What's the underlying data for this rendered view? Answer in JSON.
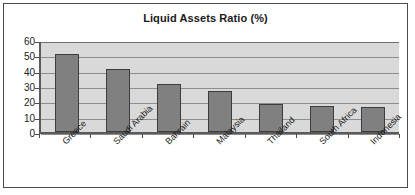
{
  "chart_data": {
    "type": "bar",
    "title": "Liquid Assets Ratio (%)",
    "xlabel": "",
    "ylabel": "",
    "ylim": [
      0,
      60
    ],
    "yticks": [
      0,
      10,
      20,
      30,
      40,
      50,
      60
    ],
    "grid": true,
    "legend": false,
    "categories": [
      "Greece",
      "Saudi Arabia",
      "Bahrain",
      "Malaysia",
      "Thailand",
      "South Africa",
      "Indonesia"
    ],
    "values": [
      51,
      41,
      31,
      26.5,
      18,
      17,
      16
    ],
    "colors": {
      "bar_fill": "#808080",
      "bar_border": "#3d3d3d",
      "plot_background": "#d9d9d9",
      "gridline": "#8d8d8d",
      "axis": "#5a5a5a",
      "frame_border": "#4a4a4a",
      "text": "#1a1a1a",
      "page_background": "#ffffff"
    }
  }
}
